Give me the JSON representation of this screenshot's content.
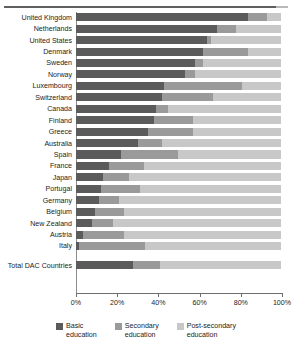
{
  "chart_data": {
    "type": "bar",
    "orientation": "horizontal",
    "stacked": true,
    "stack_total": 100,
    "title": "",
    "subtitle": "",
    "xlabel": "",
    "ylabel": "",
    "xlim": [
      0,
      100
    ],
    "xticks": [
      0,
      20,
      40,
      60,
      80,
      100
    ],
    "xticklabels": [
      "0%",
      "20%",
      "40%",
      "60%",
      "80%",
      "100%"
    ],
    "grid": false,
    "legend_position": "bottom",
    "categories": [
      "United Kingdom",
      "Netherlands",
      "United States",
      "Denmark",
      "Sweden",
      "Norway",
      "Luxembourg",
      "Switzerland",
      "Canada",
      "Finland",
      "Greece",
      "Australia",
      "Spain",
      "France",
      "Japan",
      "Portugal",
      "Germany",
      "Belgium",
      "New Zealand",
      "Austria",
      "Italy"
    ],
    "summary_category": "Total DAC Countries",
    "series": [
      {
        "name": "Basic education",
        "color": "#5b5b5b",
        "values": [
          84,
          69,
          64,
          62,
          58,
          53,
          43,
          42,
          39,
          38,
          35,
          30,
          22,
          16,
          13,
          12,
          11,
          9.5,
          8,
          3.5,
          1.5
        ],
        "summary_value": 28
      },
      {
        "name": "Secondary education",
        "color": "#9a9a9a",
        "values": [
          9,
          9,
          2,
          22,
          4,
          5,
          38,
          25,
          6,
          19,
          22,
          12,
          28,
          17,
          13,
          19,
          10,
          14,
          10,
          20,
          32
        ],
        "summary_value": 13
      },
      {
        "name": "Post-secondary education",
        "color": "#c8c8c8",
        "values": [
          7,
          22,
          34,
          16,
          38,
          42,
          19,
          33,
          55,
          43,
          43,
          58,
          50,
          67,
          74,
          69,
          79,
          76.5,
          82,
          76.5,
          66.5
        ],
        "summary_value": 59
      }
    ],
    "legend": [
      {
        "label_line1": "Basic",
        "label_line2": "education",
        "color": "#5b5b5b"
      },
      {
        "label_line1": "Secondary",
        "label_line2": "education",
        "color": "#9a9a9a"
      },
      {
        "label_line1": "Post-secondary",
        "label_line2": "education",
        "color": "#c8c8c8"
      }
    ]
  }
}
